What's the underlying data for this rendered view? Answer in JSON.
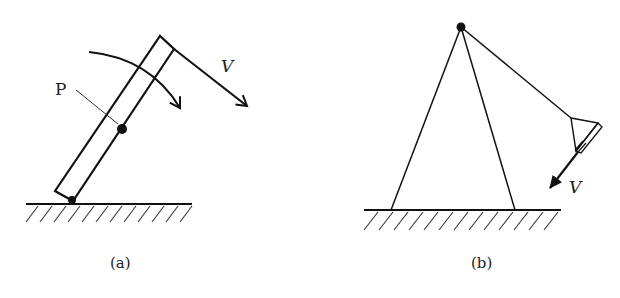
{
  "figure_a": {
    "caption": "(a)",
    "point_label": "P",
    "velocity_label": "V",
    "description": "Rigid bar pivoted at the ground, rotating clockwise; point P marked on the bar; velocity V at the tip"
  },
  "figure_b": {
    "caption": "(b)",
    "velocity_label": "V",
    "description": "A-frame stand with a pivoted arm carrying a lamp-like head moving with velocity V"
  },
  "colors": {
    "ink": "#111111",
    "background": "#ffffff"
  }
}
